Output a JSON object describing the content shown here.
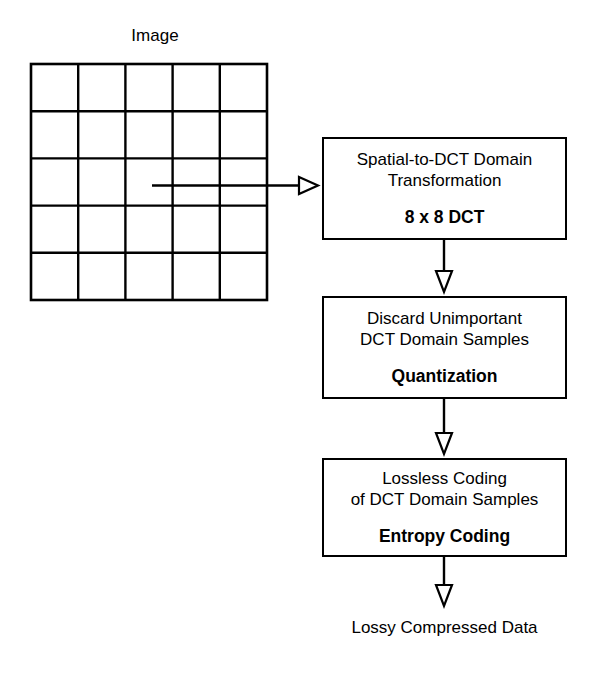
{
  "figure": {
    "title_label": "Image",
    "output_label": "Lossy Compressed Data",
    "stroke_color": "#000000",
    "background_color": "#ffffff"
  },
  "source_grid": {
    "name": "Image",
    "rows": 5,
    "columns": 5,
    "cells_total": 25
  },
  "pipeline": {
    "stages": [
      {
        "id": "spatial-to-dct",
        "line1": "Spatial-to-DCT Domain",
        "line2": "Transformation",
        "emphasis": "8 x 8 DCT"
      },
      {
        "id": "quantization",
        "line1": "Discard Unimportant",
        "line2": "DCT Domain Samples",
        "emphasis": "Quantization"
      },
      {
        "id": "entropy-coding",
        "line1": "Lossless Coding",
        "line2": "of DCT Domain Samples",
        "emphasis": "Entropy Coding"
      }
    ]
  },
  "connectors": [
    {
      "id": "grid-to-transform",
      "direction": "right",
      "head": "hollow-triangle"
    },
    {
      "id": "transform-to-quantize",
      "direction": "down",
      "head": "hollow-triangle"
    },
    {
      "id": "quantize-to-entropy",
      "direction": "down",
      "head": "hollow-triangle"
    },
    {
      "id": "entropy-to-output",
      "direction": "down",
      "head": "hollow-triangle"
    }
  ]
}
